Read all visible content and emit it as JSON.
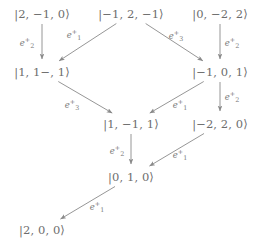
{
  "diagram": {
    "stroke_color": "#8a8a8a",
    "text_color": "#6d6d6d",
    "background": "#ffffff",
    "nodes": [
      {
        "id": "n1",
        "label": "|2, −1, 0⟩",
        "x": 42,
        "y": 14
      },
      {
        "id": "n2",
        "label": "|−1, 2, −1⟩",
        "x": 131,
        "y": 14
      },
      {
        "id": "n3",
        "label": "|0, −2, 2⟩",
        "x": 220,
        "y": 14
      },
      {
        "id": "n4",
        "label": "|1, 1−, 1⟩",
        "x": 42,
        "y": 72
      },
      {
        "id": "n5",
        "label": "|−1, 0, 1⟩",
        "x": 220,
        "y": 72
      },
      {
        "id": "n6",
        "label": "|1, −1, 1⟩",
        "x": 131,
        "y": 124
      },
      {
        "id": "n7",
        "label": "|−2, 2, 0⟩",
        "x": 220,
        "y": 124
      },
      {
        "id": "n8",
        "label": "|0, 1, 0⟩",
        "x": 131,
        "y": 177
      },
      {
        "id": "n9",
        "label": "|2, 0, 0⟩",
        "x": 42,
        "y": 230
      }
    ],
    "edges": [
      {
        "from": "n1",
        "to": "n4",
        "op": "e",
        "sub": "2",
        "sup": "+",
        "lx": 27,
        "ly": 43
      },
      {
        "from": "n2",
        "to": "n4",
        "op": "e",
        "sub": "1",
        "sup": "+",
        "lx": 74,
        "ly": 35
      },
      {
        "from": "n2",
        "to": "n5",
        "op": "e",
        "sub": "3",
        "sup": "+",
        "lx": 176,
        "ly": 36
      },
      {
        "from": "n3",
        "to": "n5",
        "op": "e",
        "sub": "2",
        "sup": "+",
        "lx": 232,
        "ly": 43
      },
      {
        "from": "n4",
        "to": "n6",
        "op": "e",
        "sub": "3",
        "sup": "+",
        "lx": 72,
        "ly": 105
      },
      {
        "from": "n5",
        "to": "n6",
        "op": "e",
        "sub": "1",
        "sup": "+",
        "lx": 180,
        "ly": 105
      },
      {
        "from": "n5",
        "to": "n7",
        "op": "e",
        "sub": "2",
        "sup": "+",
        "lx": 232,
        "ly": 97
      },
      {
        "from": "n6",
        "to": "n8",
        "op": "e",
        "sub": "2",
        "sup": "+",
        "lx": 117,
        "ly": 151
      },
      {
        "from": "n7",
        "to": "n8",
        "op": "e",
        "sub": "1",
        "sup": "+",
        "lx": 180,
        "ly": 155
      },
      {
        "from": "n8",
        "to": "n9",
        "op": "e",
        "sub": "1",
        "sup": "+",
        "lx": 97,
        "ly": 207
      }
    ]
  }
}
